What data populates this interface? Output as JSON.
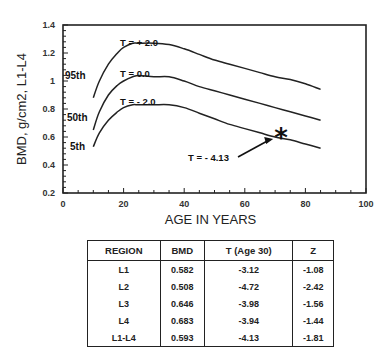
{
  "chart_data": {
    "type": "line",
    "title": "",
    "xlabel": "AGE IN YEARS",
    "ylabel": "BMD, g/cm2, L1-L4",
    "xlim": [
      0,
      100
    ],
    "ylim": [
      0.2,
      1.4
    ],
    "xticks": [
      0,
      20,
      40,
      60,
      80,
      100
    ],
    "yticks": [
      0.2,
      0.4,
      0.6,
      0.8,
      1,
      1.2,
      1.4
    ],
    "grid": false,
    "series": [
      {
        "name": "T = + 2.0",
        "percentile": "95th",
        "x": [
          10,
          12,
          15,
          18,
          20,
          23,
          25,
          30,
          35,
          40,
          45,
          50,
          55,
          60,
          65,
          70,
          75,
          80,
          85
        ],
        "y": [
          0.88,
          1.0,
          1.12,
          1.2,
          1.24,
          1.27,
          1.27,
          1.27,
          1.26,
          1.23,
          1.19,
          1.15,
          1.12,
          1.09,
          1.06,
          1.03,
          1.01,
          0.98,
          0.94
        ]
      },
      {
        "name": "T = 0.0",
        "percentile": "50th",
        "x": [
          10,
          12,
          15,
          18,
          20,
          23,
          25,
          30,
          35,
          40,
          45,
          50,
          55,
          60,
          65,
          70,
          75,
          80,
          85
        ],
        "y": [
          0.65,
          0.78,
          0.9,
          0.97,
          1.0,
          1.03,
          1.04,
          1.03,
          1.03,
          1.0,
          0.96,
          0.93,
          0.9,
          0.87,
          0.84,
          0.81,
          0.78,
          0.75,
          0.72
        ]
      },
      {
        "name": "T = - 2.0",
        "percentile": "5th",
        "x": [
          10,
          12,
          15,
          18,
          20,
          23,
          25,
          30,
          35,
          40,
          45,
          50,
          55,
          60,
          65,
          70,
          75,
          80,
          85
        ],
        "y": [
          0.53,
          0.63,
          0.72,
          0.78,
          0.81,
          0.83,
          0.83,
          0.83,
          0.83,
          0.81,
          0.77,
          0.73,
          0.69,
          0.66,
          0.63,
          0.6,
          0.58,
          0.55,
          0.52
        ]
      }
    ],
    "percentile_labels": [
      "95th",
      "50th",
      "5th"
    ],
    "annotations": [
      {
        "text": "T = - 4.13",
        "marker": "*",
        "point": {
          "x": 72,
          "y": 0.593
        }
      }
    ]
  },
  "table": {
    "headers": [
      "REGION",
      "BMD",
      "T (Age 30)",
      "Z"
    ],
    "rows": [
      [
        "L1",
        "0.582",
        "-3.12",
        "-1.08"
      ],
      [
        "L2",
        "0.508",
        "-4.72",
        "-2.42"
      ],
      [
        "L3",
        "0.646",
        "-3.98",
        "-1.56"
      ],
      [
        "L4",
        "0.683",
        "-3.94",
        "-1.44"
      ],
      [
        "L1-L4",
        "0.593",
        "-4.13",
        "-1.81"
      ]
    ]
  }
}
